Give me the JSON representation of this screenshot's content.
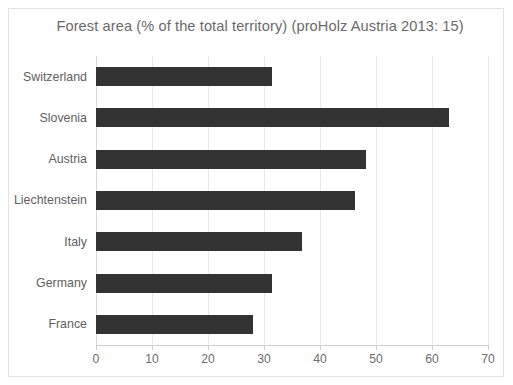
{
  "chart_data": {
    "type": "bar",
    "orientation": "horizontal",
    "title": "Forest area (% of the total territory)  (proHolz Austria 2013: 15)",
    "xlabel": "",
    "ylabel": "",
    "xlim": [
      0,
      70
    ],
    "xticks": [
      0,
      10,
      20,
      30,
      40,
      50,
      60,
      70
    ],
    "grid": true,
    "legend": "none",
    "bar_color": "#333333",
    "categories": [
      "Switzerland",
      "Slovenia",
      "Austria",
      "Liechtenstein",
      "Italy",
      "Germany",
      "France"
    ],
    "values": [
      31.4,
      63.0,
      48.2,
      46.2,
      36.8,
      31.4,
      28.0
    ],
    "series": [
      {
        "name": "Forest area (% of the total territory)",
        "values": [
          31.4,
          63.0,
          48.2,
          46.2,
          36.8,
          31.4,
          28.0
        ]
      }
    ]
  },
  "axis": {
    "tick_labels": [
      "0",
      "10",
      "20",
      "30",
      "40",
      "50",
      "60",
      "70"
    ]
  }
}
